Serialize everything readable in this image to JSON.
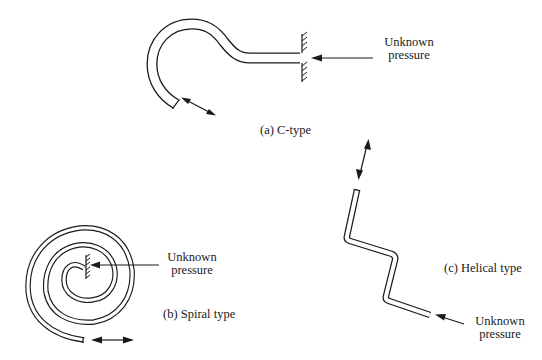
{
  "figure": {
    "panels": [
      {
        "id": "a",
        "caption": "(a) C-type",
        "pressure_label_line1": "Unknown",
        "pressure_label_line2": "pressure"
      },
      {
        "id": "b",
        "caption": "(b) Spiral type",
        "pressure_label_line1": "Unknown",
        "pressure_label_line2": "pressure"
      },
      {
        "id": "c",
        "caption": "(c) Helical type",
        "pressure_label_line1": "Unknown",
        "pressure_label_line2": "pressure"
      }
    ],
    "colors": {
      "ink": "#1a1a1a",
      "background": "#ffffff"
    }
  }
}
